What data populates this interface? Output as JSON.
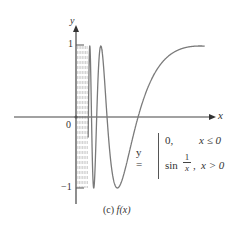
{
  "figure": {
    "caption_label": "(c)",
    "caption_func": "f(x)",
    "axis_x_label": "x",
    "axis_y_label": "y",
    "origin_label": "0",
    "tick_pos_label": "1",
    "tick_neg_label": "−1"
  },
  "equation": {
    "lhs": "y =",
    "case1_value": "0,",
    "case1_condition": "x ≤ 0",
    "case2_func": "sin",
    "case2_frac_num": "1",
    "case2_frac_den": "x",
    "case2_comma": ",",
    "case2_condition": "x > 0"
  },
  "colors": {
    "axis": "#444444",
    "curve": "#7a7a7a",
    "dense": "#bdbdbd",
    "text": "#333333"
  },
  "chart_data": {
    "type": "line",
    "title": "(c) f(x)",
    "function": "y = 0 for x <= 0; y = sin(1/x) for x > 0",
    "xlabel": "x",
    "ylabel": "y",
    "ylim": [
      -1,
      1
    ],
    "xlim": [
      -0.3,
      0.7
    ],
    "y_ticks": [
      -1,
      1
    ],
    "origin": "0",
    "grid": false,
    "series": [
      {
        "name": "f(x) = 0 (x ≤ 0)",
        "x": [
          -0.32,
          0
        ],
        "y": [
          0,
          0
        ]
      },
      {
        "name": "f(x) = sin(1/x) (x > 0)",
        "x": [
          0.0707,
          0.0909,
          0.127,
          0.159,
          0.212,
          0.318,
          0.5,
          0.66
        ],
        "y": [
          1,
          -1,
          1,
          0,
          -1,
          0,
          0.91,
          1.0
        ]
      }
    ],
    "annotations": [
      "dense oscillation region near x = 0 shown dashed/gray"
    ]
  },
  "layout": {
    "origin_px": [
      76,
      117
    ],
    "x_unit_px": 195,
    "y_unit_px": 71
  }
}
